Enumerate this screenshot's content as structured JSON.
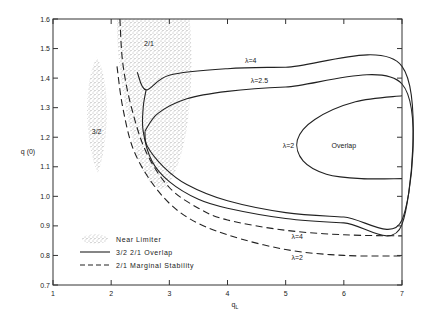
{
  "chart_data": {
    "type": "line",
    "title": "",
    "xlabel": "q_L",
    "ylabel": "q (0)",
    "xlim": [
      1,
      7
    ],
    "ylim": [
      0.7,
      1.6
    ],
    "x_ticks": [
      1,
      2,
      3,
      4,
      5,
      6,
      7
    ],
    "y_ticks": [
      0.7,
      0.8,
      0.9,
      1.0,
      1.1,
      1.2,
      1.3,
      1.4,
      1.5,
      1.6
    ],
    "y_tick_labels": [
      "0.7",
      "0.8",
      "0.9",
      "1.0",
      "1.1",
      "1.2",
      "1.3",
      "1.4",
      "1.5",
      "1.6"
    ],
    "x_tick_labels": [
      "1",
      "2",
      "3",
      "4",
      "5",
      "6",
      "7"
    ],
    "grid": false,
    "legend_position": "lower-left inside",
    "legend": [
      {
        "label": "Near Limiter",
        "style": "stippled"
      },
      {
        "label": "3/2  2/1  Overlap",
        "style": "solid"
      },
      {
        "label": "2/1  Marginal Stability",
        "style": "dashed"
      }
    ],
    "regions": [
      {
        "name": "3/2",
        "type": "near-limiter",
        "q_L_range": [
          1.55,
          1.95
        ],
        "q0_range": [
          1.08,
          1.47
        ],
        "label_at": [
          1.75,
          1.22
        ]
      },
      {
        "name": "2/1",
        "type": "near-limiter",
        "q_L_range": [
          2.1,
          3.35
        ],
        "q0_range": [
          1.03,
          1.6
        ],
        "label_at": [
          2.65,
          1.52
        ]
      }
    ],
    "series": [
      {
        "name": "λ=4",
        "kind": "overlap",
        "style": "solid",
        "points": [
          [
            2.45,
            1.42
          ],
          [
            2.6,
            1.36
          ],
          [
            3.0,
            1.41
          ],
          [
            4.0,
            1.432
          ],
          [
            5.0,
            1.437
          ],
          [
            7.0,
            1.44
          ],
          [
            7.0,
            0.905
          ],
          [
            6.0,
            0.91
          ],
          [
            5.0,
            0.925
          ],
          [
            4.0,
            0.96
          ],
          [
            3.5,
            0.99
          ],
          [
            3.0,
            1.05
          ],
          [
            2.7,
            1.12
          ],
          [
            2.55,
            1.22
          ],
          [
            2.55,
            1.3
          ],
          [
            2.6,
            1.36
          ]
        ],
        "label": "λ=4",
        "label_at": [
          4.3,
          1.45
        ]
      },
      {
        "name": "λ=2.5",
        "kind": "overlap",
        "style": "solid",
        "points": [
          [
            2.58,
            1.22
          ],
          [
            2.8,
            1.28
          ],
          [
            3.3,
            1.33
          ],
          [
            4.0,
            1.355
          ],
          [
            5.0,
            1.37
          ],
          [
            7.0,
            1.38
          ],
          [
            7.0,
            0.92
          ],
          [
            6.0,
            0.93
          ],
          [
            5.0,
            0.945
          ],
          [
            4.0,
            0.985
          ],
          [
            3.3,
            1.04
          ],
          [
            2.9,
            1.1
          ],
          [
            2.62,
            1.17
          ],
          [
            2.58,
            1.22
          ]
        ],
        "label": "λ=2.5",
        "label_at": [
          4.4,
          1.385
        ]
      },
      {
        "name": "λ=2",
        "kind": "overlap",
        "style": "solid",
        "points": [
          [
            7.0,
            1.34
          ],
          [
            6.2,
            1.32
          ],
          [
            5.5,
            1.26
          ],
          [
            5.2,
            1.19
          ],
          [
            5.3,
            1.12
          ],
          [
            5.7,
            1.075
          ],
          [
            6.3,
            1.06
          ],
          [
            7.0,
            1.06
          ]
        ],
        "label": "λ=2",
        "label_at": [
          4.95,
          1.165
        ]
      },
      {
        "name": "λ=4 marginal",
        "kind": "marginal-stability",
        "style": "dashed",
        "points": [
          [
            2.15,
            1.6
          ],
          [
            2.2,
            1.45
          ],
          [
            2.35,
            1.3
          ],
          [
            2.6,
            1.15
          ],
          [
            3.0,
            1.03
          ],
          [
            3.5,
            0.96
          ],
          [
            4.0,
            0.92
          ],
          [
            5.0,
            0.885
          ],
          [
            6.0,
            0.87
          ],
          [
            7.0,
            0.866
          ]
        ],
        "label": "λ=4",
        "label_at": [
          5.1,
          0.855
        ]
      },
      {
        "name": "λ=2 marginal",
        "kind": "marginal-stability",
        "style": "dashed",
        "points": [
          [
            2.1,
            1.44
          ],
          [
            2.2,
            1.3
          ],
          [
            2.4,
            1.15
          ],
          [
            2.8,
            1.02
          ],
          [
            3.3,
            0.93
          ],
          [
            4.0,
            0.87
          ],
          [
            5.0,
            0.82
          ],
          [
            6.0,
            0.8
          ],
          [
            7.0,
            0.798
          ]
        ],
        "label": "λ=2",
        "label_at": [
          5.1,
          0.785
        ]
      }
    ],
    "annotations": [
      {
        "text": "Overlap",
        "at": [
          6.0,
          1.165
        ]
      },
      {
        "text": "3/2",
        "at": [
          1.75,
          1.21
        ]
      },
      {
        "text": "2/1",
        "at": [
          2.65,
          1.51
        ]
      }
    ]
  }
}
